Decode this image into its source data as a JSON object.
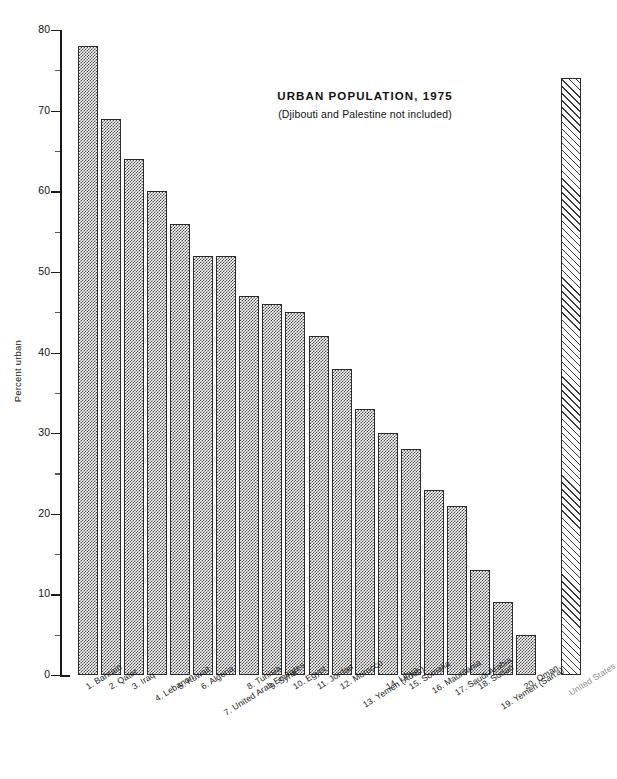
{
  "chart_data": {
    "type": "bar",
    "title": "URBAN POPULATION, 1975",
    "subtitle": "(Djibouti and Palestine not included)",
    "xlabel": "",
    "ylabel": "Percent urban",
    "ylim": [
      0,
      80
    ],
    "ytick_labels": [
      "0",
      "10",
      "20",
      "30",
      "40",
      "50",
      "60",
      "70",
      "80"
    ],
    "ytick_values": [
      0,
      10,
      20,
      30,
      40,
      50,
      60,
      70,
      80
    ],
    "yminor_values": [
      5,
      15,
      25,
      35,
      45,
      55,
      65,
      75
    ],
    "grid": false,
    "legend": "none",
    "categories": [
      "1.  Bahrain",
      "2.  Qatar",
      "3.  Iraq",
      "4.  Lebanon",
      "5.  Kuwait",
      "6.  Algeria",
      "7.  United Arab Emirates",
      "8.  Tunisia",
      "9.  Syria",
      "10.  Egypt",
      "11.  Jordan",
      "12.  Morocco",
      "13.  Yemen (Aden)",
      "14.  Libya",
      "15.  Somalia",
      "16.  Mauritania",
      "17.  Saudi Arabia",
      "18.  Sudan",
      "19.  Yemen (San'a)",
      "20.  Oman",
      "United States"
    ],
    "values": [
      78,
      69,
      64,
      60,
      56,
      52,
      52,
      47,
      46,
      45,
      42,
      38,
      33,
      30,
      28,
      23,
      21,
      13,
      9,
      5,
      74
    ],
    "series": [
      {
        "name": "Percent urban, 1975",
        "values": [
          78,
          69,
          64,
          60,
          56,
          52,
          52,
          47,
          46,
          45,
          42,
          38,
          33,
          30,
          28,
          23,
          21,
          13,
          9,
          5,
          74
        ]
      }
    ],
    "bar_styles": [
      "checker",
      "checker",
      "checker",
      "checker",
      "checker",
      "checker",
      "checker",
      "checker",
      "checker",
      "checker",
      "checker",
      "checker",
      "checker",
      "checker",
      "checker",
      "checker",
      "checker",
      "checker",
      "checker",
      "checker",
      "hatch"
    ],
    "label_styles": [
      "normal",
      "normal",
      "normal",
      "normal",
      "normal",
      "normal",
      "normal",
      "normal",
      "normal",
      "normal",
      "normal",
      "normal",
      "normal",
      "normal",
      "normal",
      "normal",
      "normal",
      "normal",
      "normal",
      "normal",
      "muted"
    ],
    "annotations": [],
    "colors": {
      "axis": "#1a1a1a",
      "bar_edge": "#2b2b2b",
      "bar_fill": "#4a4a4a",
      "us_label": "#8d8d8d",
      "background": "#ffffff"
    }
  }
}
